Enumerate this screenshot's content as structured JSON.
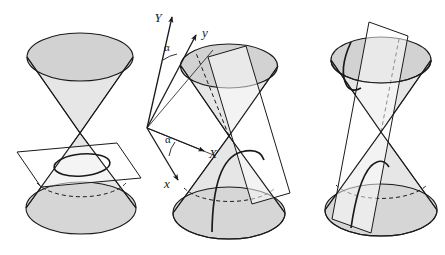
{
  "figure": {
    "background_color": "#ffffff",
    "stroke_color": "#1a1a1a",
    "cone_cap_fill": "#d2d2d2",
    "cone_body_fill": "#e6e6e6",
    "plane_fill": "#ffffff",
    "panels": [
      {
        "id": "panel-ellipse",
        "name": "ellipse-section",
        "section_type": "ellipse",
        "description": "Plane cuts one nappe of the double cone producing an ellipse"
      },
      {
        "id": "panel-parabola",
        "name": "parabola-section",
        "section_type": "parabola",
        "description": "Plane parallel to a generator cuts one nappe producing a parabola",
        "axes": {
          "Y_label": "Y",
          "y_label": "y",
          "X_label": "X",
          "x_label": "x",
          "angle_upper_label": "α",
          "angle_lower_label": "α"
        }
      },
      {
        "id": "panel-hyperbola",
        "name": "hyperbola-section",
        "section_type": "hyperbola",
        "description": "Plane cuts both nappes of the double cone producing a hyperbola"
      }
    ]
  }
}
